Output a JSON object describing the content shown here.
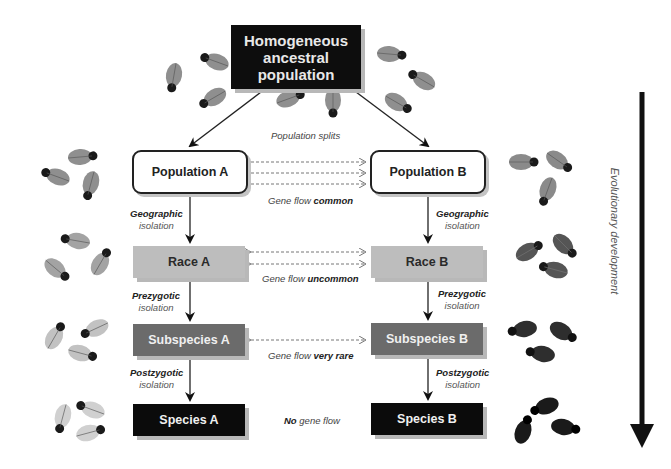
{
  "diagram": {
    "root": {
      "label": "Homogeneous ancestral population",
      "line1": "Homogeneous",
      "line2": "ancestral",
      "line3": "population"
    },
    "split_label": "Population splits",
    "stages": [
      {
        "id": "population",
        "left": "Population A",
        "right": "Population B",
        "fill": "#ffffff"
      },
      {
        "id": "race",
        "left": "Race A",
        "right": "Race B",
        "fill": "#bdbdbd"
      },
      {
        "id": "subspecies",
        "left": "Subspecies A",
        "right": "Subspecies B",
        "fill": "#6b6b6b"
      },
      {
        "id": "species",
        "left": "Species A",
        "right": "Species B",
        "fill": "#0b0b0b"
      }
    ],
    "gene_flow": [
      {
        "prefix": "Gene flow",
        "emph": "common",
        "arrows": 3
      },
      {
        "prefix": "Gene flow",
        "emph": "uncommon",
        "arrows": 2
      },
      {
        "prefix": "Gene flow",
        "emph": "very rare",
        "arrows": 1
      },
      {
        "emph": "No",
        "suffix": "gene flow",
        "arrows": 0
      }
    ],
    "isolation": [
      {
        "kind": "Geographic",
        "word": "isolation"
      },
      {
        "kind": "Prezygotic",
        "word": "isolation"
      },
      {
        "kind": "Postzygotic",
        "word": "isolation"
      }
    ],
    "axis_label": "Evolutionary development",
    "beetle_colors": {
      "ancestral": "#8f8f8f",
      "lineage_a": [
        "#8f8f8f",
        "#a3a3a3",
        "#c2c2c2",
        "#d0d0d0"
      ],
      "lineage_b": [
        "#8a8a8a",
        "#555555",
        "#2e2e2e",
        "#1a1a1a"
      ]
    }
  }
}
